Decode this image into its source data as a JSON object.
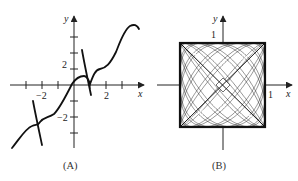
{
  "figures": [
    {
      "id": "A",
      "caption": "(A)",
      "x_axis_label": "x",
      "y_axis_label": "y",
      "x_tick_labels": [
        "−2",
        "2"
      ],
      "y_tick_labels": [
        "2",
        "−2"
      ]
    },
    {
      "id": "B",
      "caption": "(B)",
      "x_axis_label": "x",
      "y_axis_label": "y",
      "x_tick_labels": [
        "1"
      ],
      "y_tick_labels": [
        "1"
      ]
    }
  ],
  "chart_data": [
    {
      "type": "line",
      "title": "(A)",
      "xlabel": "x",
      "ylabel": "y",
      "xlim": [
        -4,
        4
      ],
      "ylim": [
        -4,
        5
      ],
      "x_ticks": [
        -3,
        -2,
        -1,
        0,
        1,
        2,
        3,
        4
      ],
      "y_ticks": [
        -3,
        -2,
        -1,
        0,
        1,
        2,
        3,
        4
      ],
      "labeled_ticks": {
        "x": [
          -2,
          2
        ],
        "y": [
          2,
          -2
        ]
      },
      "grid": false,
      "series": [
        {
          "name": "oscillating curve with steep segments",
          "points": [
            [
              -3.9,
              -3.9
            ],
            [
              -3.0,
              -2.6
            ],
            [
              -2.6,
              -2.5
            ],
            [
              -2.2,
              -2.3
            ],
            [
              -1.9,
              -2.15
            ],
            [
              -1.3,
              -1.8
            ],
            [
              -0.5,
              -0.6
            ],
            [
              0.0,
              0.2
            ],
            [
              0.4,
              0.6
            ],
            [
              0.8,
              0.55
            ],
            [
              1.0,
              0.4
            ],
            [
              1.3,
              0.9
            ],
            [
              1.8,
              1.0
            ],
            [
              2.5,
              1.7
            ],
            [
              3.2,
              3.2
            ],
            [
              3.6,
              3.6
            ],
            [
              3.9,
              3.4
            ]
          ]
        },
        {
          "name": "steep segment near x=-2",
          "points": [
            [
              -2.6,
              -1.0
            ],
            [
              -2.4,
              -2.0
            ],
            [
              -2.1,
              -3.7
            ]
          ]
        },
        {
          "name": "steep segment near x=1",
          "points": [
            [
              0.5,
              2.2
            ],
            [
              0.8,
              1.3
            ],
            [
              1.1,
              -0.6
            ]
          ]
        }
      ]
    },
    {
      "type": "line",
      "title": "(B)",
      "xlabel": "x",
      "ylabel": "y",
      "xlim": [
        -1,
        1
      ],
      "ylim": [
        -1,
        1
      ],
      "labeled_ticks": {
        "x": [
          1
        ],
        "y": [
          1
        ]
      },
      "grid": false,
      "description": "Dense parametric (Lissajous-like) curve filling the square [-1,1]x[-1,1] with white lens-shaped gaps along both diagonals and a small white diamond at the origin"
    }
  ]
}
